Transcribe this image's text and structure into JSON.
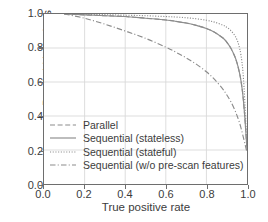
{
  "chart_data": {
    "type": "line",
    "title": "",
    "xlabel": "True positive rate",
    "ylabel": "Bandwidth savings",
    "xlim": [
      0.0,
      1.0
    ],
    "ylim": [
      0.0,
      1.0
    ],
    "xticks": [
      "0.0",
      "0.2",
      "0.4",
      "0.6",
      "0.8",
      "1.0"
    ],
    "yticks": [
      "0.0",
      "0.2",
      "0.4",
      "0.6",
      "0.8",
      "1.0"
    ],
    "xtick_values": [
      0.0,
      0.2,
      0.4,
      0.6,
      0.8,
      1.0
    ],
    "ytick_values": [
      0.0,
      0.2,
      0.4,
      0.6,
      0.8,
      1.0
    ],
    "grid": true,
    "legend_position": "lower left",
    "line_color": "#8c8c8c",
    "axis_color": "#6e6e6e",
    "grid_color": "#d9d9d9",
    "series": [
      {
        "name": "Parallel",
        "style": "dashed",
        "x": [
          0.1,
          0.2,
          0.3,
          0.4,
          0.5,
          0.6,
          0.65,
          0.7,
          0.75,
          0.8,
          0.84,
          0.88,
          0.9,
          0.92,
          0.94,
          0.95,
          0.96,
          0.97,
          0.98,
          0.99,
          1.0
        ],
        "values": [
          1.0,
          0.995,
          0.99,
          0.985,
          0.975,
          0.965,
          0.957,
          0.947,
          0.933,
          0.915,
          0.893,
          0.86,
          0.835,
          0.8,
          0.75,
          0.715,
          0.67,
          0.61,
          0.52,
          0.38,
          0.2
        ]
      },
      {
        "name": "Sequential (stateless)",
        "style": "solid",
        "x": [
          0.1,
          0.2,
          0.3,
          0.4,
          0.5,
          0.6,
          0.65,
          0.7,
          0.75,
          0.8,
          0.84,
          0.88,
          0.9,
          0.92,
          0.94,
          0.95,
          0.96,
          0.97,
          0.98,
          0.99,
          1.0
        ],
        "values": [
          1.0,
          0.995,
          0.99,
          0.985,
          0.975,
          0.965,
          0.957,
          0.947,
          0.933,
          0.915,
          0.893,
          0.86,
          0.835,
          0.8,
          0.75,
          0.715,
          0.67,
          0.61,
          0.52,
          0.38,
          0.2
        ]
      },
      {
        "name": "Sequential (stateful)",
        "style": "dotted",
        "x": [
          0.1,
          0.2,
          0.3,
          0.4,
          0.5,
          0.6,
          0.65,
          0.7,
          0.75,
          0.8,
          0.84,
          0.88,
          0.9,
          0.92,
          0.94,
          0.95,
          0.96,
          0.97,
          0.98,
          0.99,
          1.0
        ],
        "values": [
          1.0,
          0.998,
          0.996,
          0.993,
          0.99,
          0.985,
          0.982,
          0.978,
          0.972,
          0.963,
          0.952,
          0.935,
          0.922,
          0.903,
          0.873,
          0.85,
          0.815,
          0.76,
          0.66,
          0.47,
          0.215
        ]
      },
      {
        "name": "Sequential (w/o pre-scan features)",
        "style": "dashdot",
        "x": [
          0.1,
          0.2,
          0.3,
          0.4,
          0.5,
          0.6,
          0.65,
          0.7,
          0.75,
          0.8,
          0.84,
          0.88,
          0.9,
          0.92,
          0.94,
          0.95,
          0.96,
          0.97,
          0.98,
          0.99,
          1.0
        ],
        "values": [
          1.0,
          0.975,
          0.94,
          0.9,
          0.857,
          0.805,
          0.775,
          0.742,
          0.705,
          0.66,
          0.615,
          0.56,
          0.525,
          0.485,
          0.435,
          0.405,
          0.372,
          0.332,
          0.285,
          0.235,
          0.185
        ]
      }
    ]
  },
  "legend": {
    "items": [
      {
        "label": "Parallel",
        "style": "dashed"
      },
      {
        "label": "Sequential (stateless)",
        "style": "solid"
      },
      {
        "label": "Sequential (stateful)",
        "style": "dotted"
      },
      {
        "label": "Sequential (w/o pre-scan features)",
        "style": "dashdot"
      }
    ]
  }
}
